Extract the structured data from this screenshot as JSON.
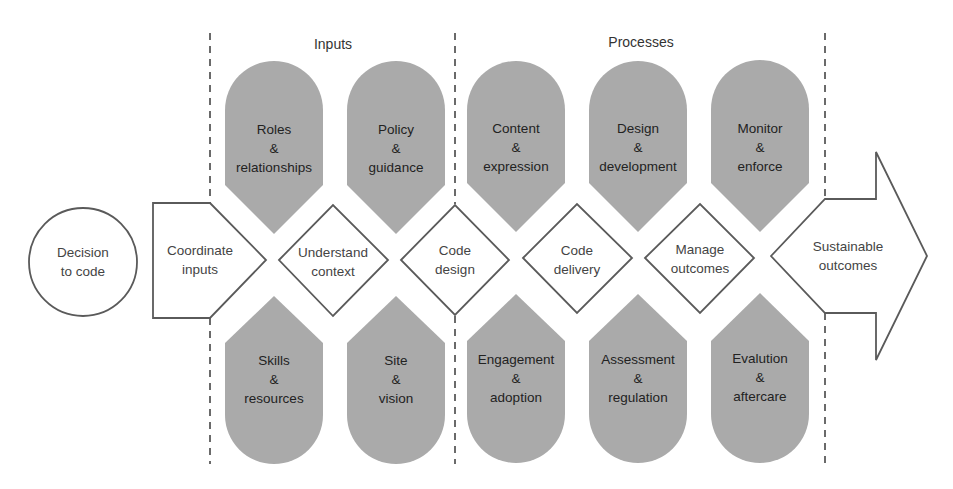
{
  "colors": {
    "petal_fill": "#aaaaaa",
    "stroke": "#5a5a5a",
    "dash": "#6a6a6a",
    "text": "#222222",
    "background": "#ffffff"
  },
  "sections": {
    "inputs": "Inputs",
    "processes": "Processes"
  },
  "start": {
    "line1": "Decision",
    "line2": "to code"
  },
  "flow": [
    {
      "line1": "Coordinate",
      "line2": "inputs"
    },
    {
      "line1": "Understand",
      "line2": "context"
    },
    {
      "line1": "Code",
      "line2": "design"
    },
    {
      "line1": "Code",
      "line2": "delivery"
    },
    {
      "line1": "Manage",
      "line2": "outcomes"
    }
  ],
  "end": {
    "line1": "Sustainable",
    "line2": "outcomes"
  },
  "top_petals": [
    {
      "line1": "Roles",
      "amp": "&",
      "line2": "relationships"
    },
    {
      "line1": "Policy",
      "amp": "&",
      "line2": "guidance"
    },
    {
      "line1": "Content",
      "amp": "&",
      "line2": "expression"
    },
    {
      "line1": "Design",
      "amp": "&",
      "line2": "development"
    },
    {
      "line1": "Monitor",
      "amp": "&",
      "line2": "enforce"
    }
  ],
  "bottom_petals": [
    {
      "line1": "Skills",
      "amp": "&",
      "line2": "resources"
    },
    {
      "line1": "Site",
      "amp": "&",
      "line2": "vision"
    },
    {
      "line1": "Engagement",
      "amp": "&",
      "line2": "adoption"
    },
    {
      "line1": "Assessment",
      "amp": "&",
      "line2": "regulation"
    },
    {
      "line1": "Evalution",
      "amp": "&",
      "line2": "aftercare"
    }
  ]
}
